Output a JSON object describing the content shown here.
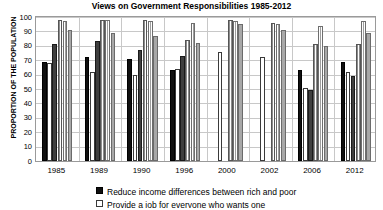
{
  "chart_data": {
    "type": "bar",
    "title": "Views on Government Responsibilities 1985-2012",
    "xlabel": "",
    "ylabel": "PROPORTION OF THE POPULATION",
    "ylim": [
      0,
      100
    ],
    "yticks": [
      100,
      90,
      80,
      70,
      60,
      50,
      40,
      30,
      20,
      10,
      0
    ],
    "grid": true,
    "legend_position": "bottom",
    "categories": [
      "1985",
      "1989",
      "1990",
      "1996",
      "2000",
      "2002",
      "2006",
      "2012"
    ],
    "series": [
      {
        "name": "Reduce income differences between rich and poor",
        "fill": "black-solid",
        "values": [
          69,
          72,
          71,
          63,
          null,
          null,
          63,
          69
        ]
      },
      {
        "name": "Provide a job for everyone who wants one",
        "fill": "white-dotted",
        "values": [
          68,
          62,
          60,
          64,
          76,
          72,
          51,
          62
        ]
      },
      {
        "name": "Provide decent housing for those who can't afford it",
        "fill": "dark-grey-solid",
        "values": [
          81,
          83,
          77,
          73,
          null,
          null,
          49,
          59
        ]
      },
      {
        "name": "Provide decent standard of living for the unemployed",
        "fill": "white-vertical-stripe",
        "values": [
          98,
          98,
          98,
          84,
          98,
          96,
          81,
          81
        ]
      },
      {
        "name": "Provide decent standard of living for the old",
        "fill": "grey-vertical-stripe",
        "values": [
          97,
          98,
          97,
          96,
          97,
          95,
          94,
          97
        ]
      },
      {
        "name": "Provide health care for the sick",
        "fill": "grey-solid",
        "values": [
          91,
          89,
          87,
          82,
          95,
          91,
          80,
          89
        ]
      }
    ]
  },
  "legend": {
    "items": [
      {
        "label": "Reduce income differences between rich and poor",
        "swatch": "black-solid"
      },
      {
        "label": "Provide a job for everyone who wants one",
        "swatch": "white-dotted"
      }
    ]
  },
  "colors": {
    "series_0": "#101010",
    "series_1": "#ffffff",
    "series_2": "#3f3f3f",
    "series_3": "#ffffff",
    "series_4": "#c9c9c9",
    "series_5": "#a8a8a8",
    "gridline": "#c8c8c8",
    "axis": "#9a9a9a",
    "text": "#000000"
  }
}
